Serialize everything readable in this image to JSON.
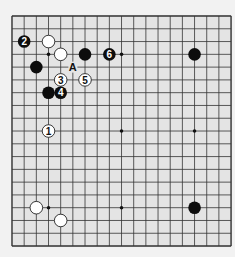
{
  "board": {
    "size": 19,
    "background": "#e4e4e4",
    "line_color": "#333333",
    "origin_x": 12,
    "origin_y": 16,
    "spacing_x": 12.17,
    "spacing_y": 12.78,
    "star_points": [
      [
        3,
        3
      ],
      [
        9,
        3
      ],
      [
        15,
        3
      ],
      [
        3,
        9
      ],
      [
        9,
        9
      ],
      [
        15,
        9
      ],
      [
        3,
        15
      ],
      [
        9,
        15
      ],
      [
        15,
        15
      ]
    ]
  },
  "stones": [
    {
      "color": "black",
      "col": 1,
      "row": 2,
      "label": "2"
    },
    {
      "color": "white",
      "col": 3,
      "row": 2,
      "label": ""
    },
    {
      "color": "white",
      "col": 4,
      "row": 3,
      "label": ""
    },
    {
      "color": "black",
      "col": 6,
      "row": 3,
      "label": ""
    },
    {
      "color": "black",
      "col": 8,
      "row": 3,
      "label": "6"
    },
    {
      "color": "black",
      "col": 15,
      "row": 3,
      "label": ""
    },
    {
      "color": "black",
      "col": 2,
      "row": 4,
      "label": ""
    },
    {
      "color": "white",
      "col": 4,
      "row": 5,
      "label": "3"
    },
    {
      "color": "white",
      "col": 6,
      "row": 5,
      "label": "5"
    },
    {
      "color": "black",
      "col": 3,
      "row": 6,
      "label": ""
    },
    {
      "color": "black",
      "col": 4,
      "row": 6,
      "label": "4"
    },
    {
      "color": "white",
      "col": 3,
      "row": 9,
      "label": "1"
    },
    {
      "color": "white",
      "col": 2,
      "row": 15,
      "label": ""
    },
    {
      "color": "black",
      "col": 15,
      "row": 15,
      "label": ""
    },
    {
      "color": "white",
      "col": 4,
      "row": 16,
      "label": ""
    }
  ],
  "markers": [
    {
      "col": 5,
      "row": 4,
      "label": "A"
    }
  ]
}
